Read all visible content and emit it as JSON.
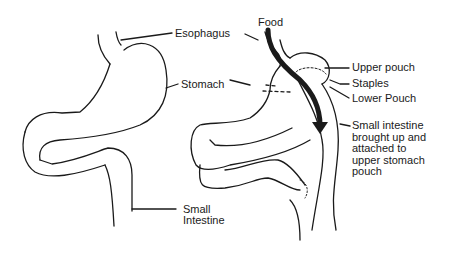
{
  "diagram": {
    "labels": {
      "esophagus": "Esophagus",
      "stomach": "Stomach",
      "small_intestine_line1": "Small",
      "small_intestine_line2": "Intestine",
      "food": "Food",
      "upper_pouch": "Upper pouch",
      "staples": "Staples",
      "lower_pouch": "Lower Pouch",
      "attached_line1": "Small intestine",
      "attached_line2": "brought up and",
      "attached_line3": "attached to",
      "attached_line4": "upper stomach",
      "attached_line5": "pouch"
    },
    "colors": {
      "stroke": "#1a1a1a",
      "background": "#ffffff"
    }
  }
}
